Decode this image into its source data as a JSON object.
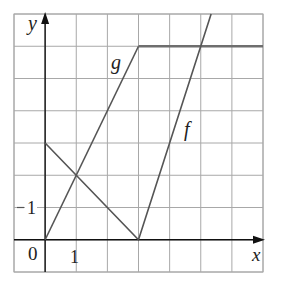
{
  "chart_data": {
    "type": "line",
    "title": "",
    "xlabel": "x",
    "ylabel": "y",
    "xlim": [
      -1,
      7
    ],
    "ylim": [
      -1,
      7
    ],
    "grid": true,
    "legend": "none",
    "tick_labels": {
      "origin": "0",
      "x": [
        {
          "value": 1,
          "label": "1"
        }
      ],
      "y": [
        {
          "value": 1,
          "label": "1"
        }
      ]
    },
    "series": [
      {
        "name": "g",
        "points": [
          [
            0,
            0
          ],
          [
            3,
            6
          ],
          [
            7,
            6
          ]
        ],
        "label_position": [
          2.3,
          5.4
        ],
        "color": "#555555"
      },
      {
        "name": "f",
        "points": [
          [
            0,
            3
          ],
          [
            3,
            0
          ],
          [
            5.333,
            7
          ]
        ],
        "label_position": [
          4.6,
          3.3
        ],
        "color": "#555555"
      }
    ]
  },
  "labels": {
    "x_axis": "x",
    "y_axis": "y",
    "origin": "0",
    "x_tick_1": "1",
    "y_tick_1": "1",
    "series_g": "g",
    "series_f": "f"
  },
  "colors": {
    "grid": "#a8a8a8",
    "axis": "#111111",
    "curve": "#555555",
    "background": "#ffffff"
  }
}
